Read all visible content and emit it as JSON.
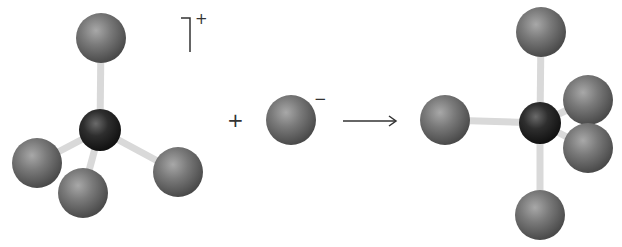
{
  "diagram": {
    "type": "ball-and-stick reaction scheme",
    "colors": {
      "central_atom": "#2a2a2a",
      "ligand_atom": "#707070",
      "bond": "#d9d9d9",
      "text": "#333333"
    },
    "reactant_cation": {
      "label": "tetrahedral cation",
      "charge": "+",
      "central": {
        "x": 100,
        "y": 130,
        "r": 21
      },
      "ligands": [
        {
          "x": 101,
          "y": 38,
          "r": 25
        },
        {
          "x": 37,
          "y": 163,
          "r": 25
        },
        {
          "x": 83,
          "y": 193,
          "r": 25
        },
        {
          "x": 178,
          "y": 172,
          "r": 25
        }
      ]
    },
    "plus_sign": "+",
    "reactant_anion": {
      "label": "anion",
      "charge": "−",
      "atom": {
        "x": 291,
        "y": 120,
        "r": 25
      }
    },
    "arrow": {
      "x1": 343,
      "y1": 121,
      "x2": 396,
      "y2": 121
    },
    "product": {
      "label": "trigonal bipyramidal product",
      "central": {
        "x": 540,
        "y": 123,
        "r": 21
      },
      "ligands": [
        {
          "x": 541,
          "y": 32,
          "r": 25
        },
        {
          "x": 445,
          "y": 120,
          "r": 25
        },
        {
          "x": 588,
          "y": 100,
          "r": 25
        },
        {
          "x": 588,
          "y": 148,
          "r": 25
        },
        {
          "x": 540,
          "y": 215,
          "r": 25
        }
      ]
    }
  }
}
